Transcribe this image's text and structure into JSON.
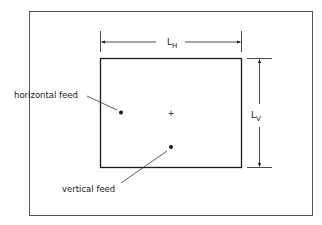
{
  "diagram": {
    "type": "rectangular patch antenna feed positions",
    "dimensions": {
      "horizontal": {
        "label": "L",
        "subscript": "H"
      },
      "vertical": {
        "label": "L",
        "subscript": "V"
      }
    },
    "labels": {
      "horizontal_feed": "horizontal feed",
      "vertical_feed": "vertical feed"
    },
    "center_marker": "+",
    "colors": {
      "line": "#1a1a1a",
      "border": "#555555",
      "background": "#ffffff"
    }
  }
}
